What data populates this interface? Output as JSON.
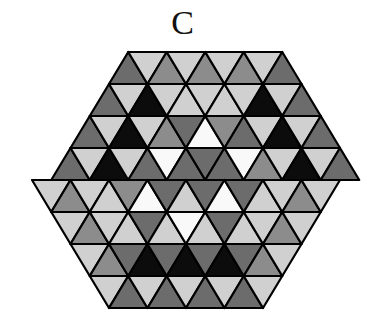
{
  "figure": {
    "label": "C"
  },
  "palette": {
    "K": "#0c0c0c",
    "D": "#6c6c6c",
    "G": "#8c8c8c",
    "L": "#d0d0d0",
    "W": "#f9f9f9"
  },
  "palette_names": {
    "K": "black",
    "D": "dark-gray",
    "G": "gray",
    "L": "light-gray",
    "W": "white"
  },
  "grid": {
    "origin_x": 32,
    "top_y": 52,
    "row_height": 32,
    "base_width": 38.5,
    "rows": [
      {
        "start_x_offset_halves": 4,
        "first": "up",
        "cells": [
          "D",
          "L",
          "G",
          "L",
          "G",
          "L",
          "G",
          "L",
          "D"
        ]
      },
      {
        "start_x_offset_halves": 3,
        "first": "up",
        "cells": [
          "D",
          "L",
          "K",
          "L",
          "L",
          "L",
          "L",
          "L",
          "K",
          "L",
          "D"
        ]
      },
      {
        "start_x_offset_halves": 2,
        "first": "up",
        "cells": [
          "D",
          "L",
          "K",
          "L",
          "G",
          "D",
          "W",
          "G",
          "D",
          "L",
          "K",
          "L",
          "D"
        ]
      },
      {
        "start_x_offset_halves": 1,
        "first": "up",
        "cells": [
          "D",
          "L",
          "K",
          "L",
          "D",
          "W",
          "D",
          "D",
          "D",
          "W",
          "G",
          "L",
          "K",
          "L",
          "D"
        ]
      },
      {
        "start_x_offset_halves": 0,
        "first": "down",
        "cells": [
          "L",
          "G",
          "L",
          "L",
          "G",
          "W",
          "D",
          "L",
          "D",
          "W",
          "D",
          "L",
          "L",
          "G",
          "L"
        ]
      },
      {
        "start_x_offset_halves": 1,
        "first": "down",
        "cells": [
          "L",
          "G",
          "L",
          "L",
          "D",
          "L",
          "W",
          "L",
          "D",
          "L",
          "L",
          "G",
          "L"
        ]
      },
      {
        "start_x_offset_halves": 2,
        "first": "down",
        "cells": [
          "L",
          "G",
          "D",
          "K",
          "D",
          "K",
          "D",
          "K",
          "D",
          "G",
          "L"
        ]
      },
      {
        "start_x_offset_halves": 3,
        "first": "down",
        "cells": [
          "L",
          "D",
          "L",
          "D",
          "L",
          "D",
          "L",
          "D",
          "L"
        ]
      }
    ]
  }
}
